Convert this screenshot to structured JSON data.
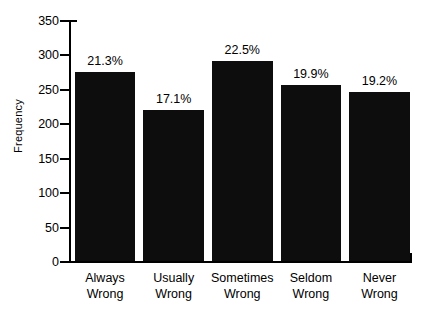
{
  "chart_data": {
    "type": "bar",
    "title": "",
    "xlabel": "",
    "ylabel": "Frequency",
    "categories": [
      "Always Wrong",
      "Usually Wrong",
      "Sometimes Wrong",
      "Seldom Wrong",
      "Never Wrong"
    ],
    "category_lines": [
      [
        "Always",
        "Wrong"
      ],
      [
        "Usually",
        "Wrong"
      ],
      [
        "Sometimes",
        "Wrong"
      ],
      [
        "Seldom",
        "Wrong"
      ],
      [
        "Never",
        "Wrong"
      ]
    ],
    "values": [
      275,
      220,
      290,
      255,
      246
    ],
    "data_labels": [
      "21.3%",
      "17.1%",
      "22.5%",
      "19.9%",
      "19.2%"
    ],
    "ylim": [
      0,
      350
    ],
    "yticks": [
      0,
      50,
      100,
      150,
      200,
      250,
      300,
      350
    ],
    "ytick_labels": [
      "0",
      "50",
      "100",
      "150",
      "200",
      "250",
      "300",
      "350"
    ],
    "grid": false,
    "legend": false,
    "bar_color": "#0d0d0d",
    "axis_color": "#000000",
    "background_color": "#ffffff"
  }
}
